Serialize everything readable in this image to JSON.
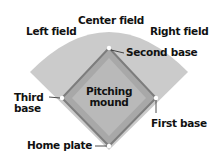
{
  "diagram": {
    "colors": {
      "outfield": "#cbcbcb",
      "infield": "#a8a8a8",
      "infield_outline": "#7d7d7d",
      "infield_inner": "#b9b9b9",
      "base": "#ffffff",
      "text": "#111111"
    },
    "labels": {
      "center_field": "Center field",
      "left_field": "Left field",
      "right_field": "Right field",
      "second_base": "Second base",
      "third_base_line1": "Third",
      "third_base_line2": "base",
      "pitching_mound_line1": "Pitching",
      "pitching_mound_line2": "mound",
      "first_base": "First base",
      "home_plate": "Home plate"
    }
  }
}
